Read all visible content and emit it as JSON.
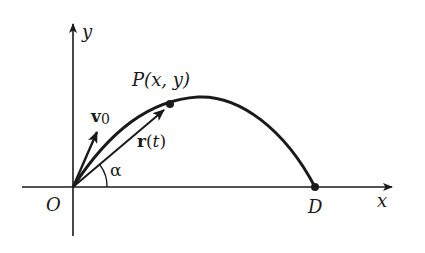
{
  "diagram": {
    "type": "projectile-motion",
    "axes": {
      "x_label": "x",
      "y_label": "y",
      "origin_label": "O"
    },
    "points": {
      "P": {
        "label": "P(x, y)"
      },
      "D": {
        "label": "D"
      }
    },
    "vectors": {
      "v0": {
        "label_main": "v",
        "label_sub": "0"
      },
      "r": {
        "label_main": "r",
        "label_paren_open": "(",
        "label_var": "t",
        "label_paren_close": ")"
      }
    },
    "angle": {
      "label": "α"
    },
    "colors": {
      "ink": "#1a1a1a",
      "background": "#ffffff"
    }
  }
}
